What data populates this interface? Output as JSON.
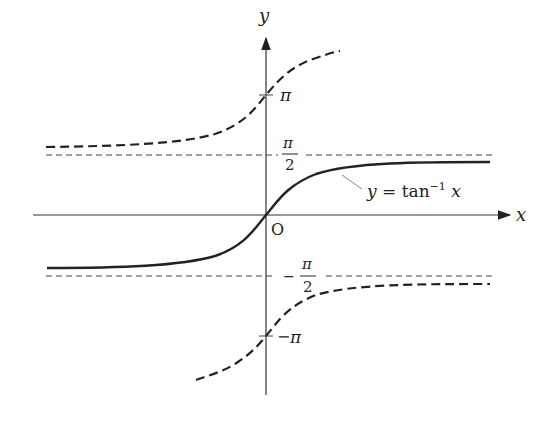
{
  "diagram": {
    "axes": {
      "x_label": "x",
      "y_label": "y",
      "origin_label": "O"
    },
    "ticks": {
      "pi": "π",
      "neg_pi_sign": "−",
      "neg_pi": "π",
      "half_pi_num": "π",
      "half_pi_den": "2",
      "neg_half_pi_sign": "−",
      "neg_half_pi_num": "π",
      "neg_half_pi_den": "2"
    },
    "curve_label": {
      "y": "y",
      "eq": " = tan",
      "sup": "−1",
      "x": " x"
    },
    "colors": {
      "ink": "#222222",
      "background": "#ffffff"
    }
  }
}
